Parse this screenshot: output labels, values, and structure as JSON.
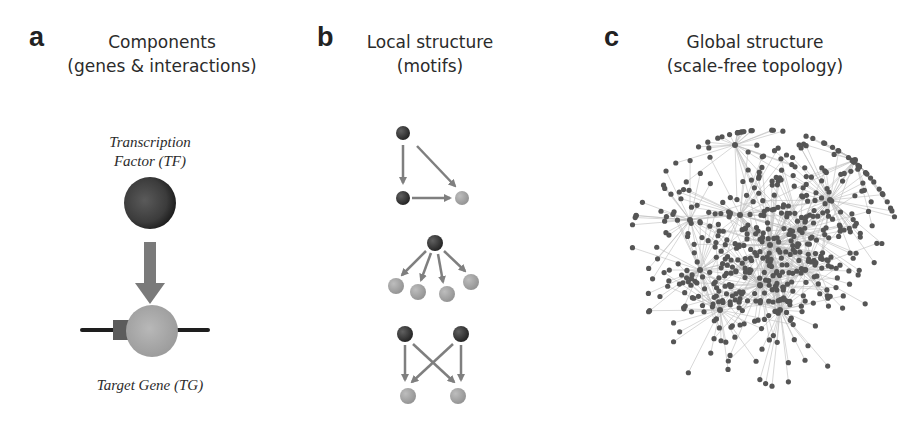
{
  "panels": [
    {
      "letter": "a",
      "title_line1": "Components",
      "title_line2": "(genes & interactions)",
      "tf_label_line1": "Transcription",
      "tf_label_line2": "Factor (TF)",
      "tg_label": "Target Gene (TG)"
    },
    {
      "letter": "b",
      "title_line1": "Local structure",
      "title_line2": "(motifs)",
      "motifs": [
        "feed-forward loop",
        "single-input module",
        "bi-fan"
      ]
    },
    {
      "letter": "c",
      "title_line1": "Global structure",
      "title_line2": "(scale-free topology)"
    }
  ],
  "colors": {
    "regulator_node": "#3a3a3a",
    "target_node": "#a8a8a8",
    "edge": "#7f7f7f",
    "network_node": "#555555",
    "network_edge": "#bdbdbd"
  }
}
